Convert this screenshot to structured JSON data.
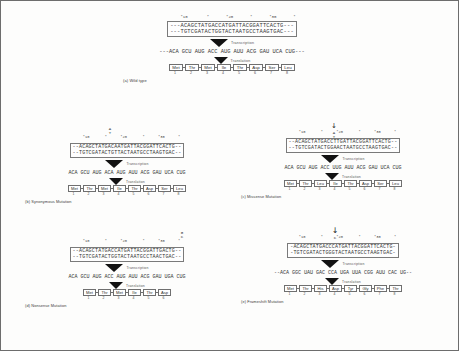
{
  "figure": {
    "step_labels": {
      "transcription": "Transcription",
      "translation": "Translation"
    }
  },
  "panels": [
    {
      "id": "a",
      "caption": "(a) Wild type",
      "ticks": "     *10        *       *20       *       *30       *",
      "dna_top": "---ACAGCTATGACCATGATTACGGATTCACTG---",
      "dna_bottom": "---TGTCGATACTGGTACTAATGCCTAAGTGAC---",
      "mrna": "---ACA GCU AUG ACC AUG AUU ACG GAU UCA CUG---",
      "mrna_codons": [
        "ACA",
        "GCU",
        "AUG",
        "ACC",
        "AUG",
        "AUU",
        "ACG",
        "GAU",
        "UCA",
        "CUG"
      ],
      "mrna_underlined": [
        "AUG",
        "ACC",
        "AUG",
        "AUU",
        "ACG",
        "GAU",
        "UCA",
        "CUG"
      ],
      "protein": [
        "Met",
        "Thr",
        "Met",
        "Ile",
        "Thr",
        "Asp",
        "Ser",
        "Leu"
      ],
      "numbers": [
        "1",
        "2",
        "3",
        "4",
        "5",
        "6",
        "7",
        "8"
      ],
      "mutation_marker": "",
      "mutation_arrow": ""
    },
    {
      "id": "b",
      "caption": "(b) Synonymous Mutation",
      "ticks": "    *10       *      *20       *      *30      *",
      "dna_top": "--ACAGCTATGACAATGATTACGGATTCACTG--",
      "dna_bottom": "--TGTCGATACTGTTACTAATGCCTAAGTGAC--",
      "mrna": "ACA GCU AUG ACA AUG AUU ACG GAU UCA CUG",
      "mrna_codons": [
        "ACA",
        "GCU",
        "AUG",
        "ACA",
        "AUG",
        "AUU",
        "ACG",
        "GAU",
        "UCA",
        "CUG"
      ],
      "mrna_underlined": [
        "AUG",
        "ACA",
        "AUG",
        "AUU",
        "ACG",
        "GAU",
        "UCA",
        "CUG"
      ],
      "protein": [
        "Met",
        "Thr",
        "Met",
        "Ile",
        "Thr",
        "Asp",
        "Ser",
        "Leu"
      ],
      "numbers": [
        "1",
        "2",
        "3",
        "4",
        "5",
        "6",
        "7",
        "8"
      ],
      "mutation_marker": "A\nT",
      "mutation_arrow": ""
    },
    {
      "id": "c",
      "caption": "(c) Missense Mutation",
      "ticks": "    *10       *      *20       *      *30      *",
      "dna_top": "--ACAGCTATGACCTTGATTACGGATTCACTG--",
      "dna_bottom": "--TGTCGATACTGGAACTAATGCCTAAGTGAC--",
      "mrna": "ACA GCU AUG ACC UUG AUU ACG GAU UCA CUG",
      "mrna_codons": [
        "ACA",
        "GCU",
        "AUG",
        "ACC",
        "UUG",
        "AUU",
        "ACG",
        "GAU",
        "UCA",
        "CUG"
      ],
      "mrna_underlined": [
        "AUG",
        "ACC",
        "UUG",
        "AUU",
        "ACG",
        "GAU",
        "UCA",
        "CUG"
      ],
      "protein": [
        "Met",
        "Thr",
        "Leu",
        "Ile",
        "Thr",
        "Asp",
        "Ser",
        "Leu"
      ],
      "numbers": [
        "1",
        "2",
        "3",
        "4",
        "5",
        "6",
        "7",
        "8"
      ],
      "mutation_marker": "A\nT",
      "mutation_arrow": "↓"
    },
    {
      "id": "d",
      "caption": "(d) Nonsense Mutation",
      "ticks": "    *10       *      *20       *      *30      *",
      "dna_top": "--ACAGCTATGACCATGATTACGGATTGACTG--",
      "dna_bottom": "--TGTCGATACTGGTACTAATGCCTAACTGAC--",
      "mrna": "ACA GCU AUG ACC AUG AUU ACG GAU UGA CUG",
      "mrna_codons": [
        "ACA",
        "GCU",
        "AUG",
        "ACC",
        "AUG",
        "AUU",
        "ACG",
        "GAU",
        "UGA",
        "CUG"
      ],
      "mrna_underlined": [
        "AUG",
        "ACC",
        "AUG",
        "AUU",
        "ACG",
        "GAU",
        "UGA",
        "CUG"
      ],
      "protein": [
        "Met",
        "Thr",
        "Met",
        "Ile",
        "Thr",
        "Asp"
      ],
      "numbers": [
        "1",
        "2",
        "3",
        "4",
        "5",
        "6"
      ],
      "mutation_marker": "G\nC",
      "mutation_arrow": ""
    },
    {
      "id": "e",
      "caption": "(e) Frameshift Mutation",
      "ticks": "    *10       *      *20       *      *30      *",
      "dna_top": "-ACAGCTATGACCCATGATTACGGATTCACTG-",
      "dna_bottom": "-TGTCGATACTGGGTACTAATGCCTAAGTGAC-",
      "mrna": "--ACA GGC UAU GAC CCA UGA UUA CGG AUU CAC UG--",
      "mrna_codons": [
        "ACA",
        "GGC",
        "UAU",
        "GAC",
        "CCA",
        "UGA",
        "UUA",
        "CGG",
        "AUU",
        "CAC",
        "UG"
      ],
      "mrna_underlined": [
        "AUG",
        "ACC",
        "CAU",
        "GAU",
        "UAC",
        "GGA",
        "UUC",
        "ACU",
        "G"
      ],
      "protein": [
        "Met",
        "Thr",
        "His",
        "Asp",
        "Tyr",
        "Gly",
        "Phe",
        "Thr"
      ],
      "numbers": [
        "1",
        "2",
        "3",
        "4",
        "5",
        "6",
        "7",
        "8"
      ],
      "mutation_marker": "C",
      "mutation_arrow": "↓"
    }
  ]
}
